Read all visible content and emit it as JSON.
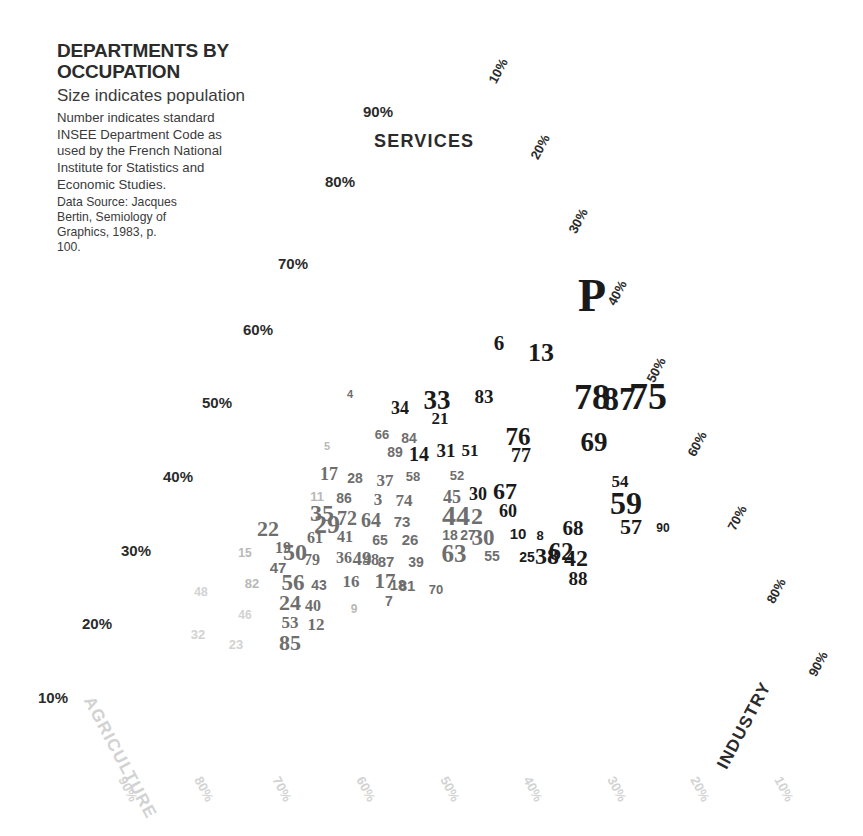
{
  "legend": {
    "title_line1": "DEPARTMENTS BY",
    "title_line2": "OCCUPATION",
    "subtitle": "Size indicates population",
    "note": "Number indicates standard INSEE Department Code as used by the French National Institute for Statistics and Economic Studies.",
    "source": "Data Source: Jacques Bertin, Semiology of Graphics, 1983, p. 100."
  },
  "axes": {
    "services_label": "SERVICES",
    "agriculture_label": "AGRICULTURE",
    "industry_label": "INDUSTRY",
    "paris_label": "P"
  },
  "colors": {
    "dark": "#1a1a1a",
    "mid": "#6e6e6e",
    "light": "#b8b8b8",
    "pale": "#d2d2d2",
    "text": "#2b2b2b"
  },
  "chart_data": {
    "type": "scatter",
    "title": "DEPARTMENTS BY OCCUPATION",
    "subtitle": "Size indicates population",
    "plot_kind": "ternary",
    "axis_names": [
      "AGRICULTURE",
      "INDUSTRY",
      "SERVICES"
    ],
    "grid": false,
    "legend_position": "top-left",
    "annotation": "Number indicates standard INSEE Department Code as used by the French National Institute for Statistics and Economic Studies.",
    "source": "Data Source: Jacques Bertin, Semiology of Graphics, 1983, p. 100.",
    "left_axis_ticks": [
      "10%",
      "20%",
      "30%",
      "40%",
      "50%",
      "60%",
      "70%",
      "80%",
      "90%"
    ],
    "right_axis_ticks": [
      "10%",
      "20%",
      "30%",
      "40%",
      "50%",
      "60%",
      "70%",
      "80%",
      "90%"
    ],
    "bottom_axis_ticks": [
      "90%",
      "80%",
      "70%",
      "60%",
      "50%",
      "40%",
      "30%",
      "20%",
      "10%"
    ],
    "point_label_field": "INSEE Department Code",
    "size_field": "population",
    "points": [
      {
        "label": "P",
        "x": 592,
        "y": 296,
        "size": 47,
        "tone": "dark"
      },
      {
        "label": "6",
        "x": 499,
        "y": 343,
        "size": 21,
        "tone": "dark"
      },
      {
        "label": "13",
        "x": 541,
        "y": 353,
        "size": 26,
        "tone": "dark"
      },
      {
        "label": "78",
        "x": 592,
        "y": 397,
        "size": 36,
        "tone": "dark"
      },
      {
        "label": "87",
        "x": 619,
        "y": 399,
        "size": 33,
        "tone": "dark"
      },
      {
        "label": "75",
        "x": 648,
        "y": 396,
        "size": 38,
        "tone": "dark"
      },
      {
        "label": "69",
        "x": 594,
        "y": 442,
        "size": 27,
        "tone": "dark"
      },
      {
        "label": "83",
        "x": 484,
        "y": 396,
        "size": 19,
        "tone": "dark"
      },
      {
        "label": "76",
        "x": 518,
        "y": 436,
        "size": 25,
        "tone": "dark"
      },
      {
        "label": "77",
        "x": 521,
        "y": 455,
        "size": 20,
        "tone": "dark"
      },
      {
        "label": "33",
        "x": 437,
        "y": 400,
        "size": 27,
        "tone": "dark"
      },
      {
        "label": "21",
        "x": 440,
        "y": 418,
        "size": 17,
        "tone": "dark"
      },
      {
        "label": "34",
        "x": 400,
        "y": 408,
        "size": 18,
        "tone": "dark"
      },
      {
        "label": "4",
        "x": 350,
        "y": 394,
        "size": 11,
        "tone": "mid"
      },
      {
        "label": "66",
        "x": 382,
        "y": 434,
        "size": 13,
        "tone": "mid"
      },
      {
        "label": "84",
        "x": 409,
        "y": 438,
        "size": 14,
        "tone": "mid"
      },
      {
        "label": "89",
        "x": 395,
        "y": 452,
        "size": 14,
        "tone": "mid"
      },
      {
        "label": "14",
        "x": 419,
        "y": 454,
        "size": 20,
        "tone": "dark"
      },
      {
        "label": "31",
        "x": 446,
        "y": 450,
        "size": 19,
        "tone": "dark"
      },
      {
        "label": "51",
        "x": 470,
        "y": 450,
        "size": 17,
        "tone": "dark"
      },
      {
        "label": "5",
        "x": 327,
        "y": 446,
        "size": 11,
        "tone": "light"
      },
      {
        "label": "52",
        "x": 457,
        "y": 475,
        "size": 13,
        "tone": "mid"
      },
      {
        "label": "54",
        "x": 620,
        "y": 481,
        "size": 17,
        "tone": "dark"
      },
      {
        "label": "59",
        "x": 626,
        "y": 503,
        "size": 32,
        "tone": "dark"
      },
      {
        "label": "57",
        "x": 631,
        "y": 527,
        "size": 22,
        "tone": "dark"
      },
      {
        "label": "90",
        "x": 663,
        "y": 528,
        "size": 12,
        "tone": "dark"
      },
      {
        "label": "67",
        "x": 505,
        "y": 491,
        "size": 24,
        "tone": "dark"
      },
      {
        "label": "60",
        "x": 508,
        "y": 511,
        "size": 18,
        "tone": "dark"
      },
      {
        "label": "17",
        "x": 329,
        "y": 474,
        "size": 18,
        "tone": "mid"
      },
      {
        "label": "28",
        "x": 355,
        "y": 478,
        "size": 14,
        "tone": "mid"
      },
      {
        "label": "37",
        "x": 385,
        "y": 480,
        "size": 17,
        "tone": "mid"
      },
      {
        "label": "58",
        "x": 413,
        "y": 476,
        "size": 13,
        "tone": "mid"
      },
      {
        "label": "11",
        "x": 317,
        "y": 496,
        "size": 13,
        "tone": "light"
      },
      {
        "label": "86",
        "x": 344,
        "y": 498,
        "size": 14,
        "tone": "mid"
      },
      {
        "label": "3",
        "x": 378,
        "y": 499,
        "size": 17,
        "tone": "mid"
      },
      {
        "label": "74",
        "x": 404,
        "y": 500,
        "size": 17,
        "tone": "mid"
      },
      {
        "label": "45",
        "x": 452,
        "y": 497,
        "size": 18,
        "tone": "mid"
      },
      {
        "label": "30",
        "x": 478,
        "y": 494,
        "size": 18,
        "tone": "dark"
      },
      {
        "label": "35",
        "x": 322,
        "y": 513,
        "size": 24,
        "tone": "mid"
      },
      {
        "label": "29",
        "x": 327,
        "y": 525,
        "size": 26,
        "tone": "mid"
      },
      {
        "label": "72",
        "x": 347,
        "y": 518,
        "size": 20,
        "tone": "mid"
      },
      {
        "label": "64",
        "x": 371,
        "y": 520,
        "size": 20,
        "tone": "mid"
      },
      {
        "label": "73",
        "x": 402,
        "y": 521,
        "size": 15,
        "tone": "mid"
      },
      {
        "label": "44",
        "x": 456,
        "y": 516,
        "size": 28,
        "tone": "mid"
      },
      {
        "label": "2",
        "x": 477,
        "y": 516,
        "size": 24,
        "tone": "mid"
      },
      {
        "label": "22",
        "x": 268,
        "y": 529,
        "size": 22,
        "tone": "mid"
      },
      {
        "label": "61",
        "x": 315,
        "y": 538,
        "size": 16,
        "tone": "mid"
      },
      {
        "label": "41",
        "x": 345,
        "y": 537,
        "size": 16,
        "tone": "mid"
      },
      {
        "label": "65",
        "x": 380,
        "y": 540,
        "size": 14,
        "tone": "mid"
      },
      {
        "label": "26",
        "x": 410,
        "y": 539,
        "size": 15,
        "tone": "mid"
      },
      {
        "label": "18",
        "x": 450,
        "y": 535,
        "size": 14,
        "tone": "mid"
      },
      {
        "label": "27",
        "x": 468,
        "y": 535,
        "size": 14,
        "tone": "mid"
      },
      {
        "label": "30b",
        "x": 483,
        "y": 537,
        "size": 23,
        "tone": "mid"
      },
      {
        "label": "10",
        "x": 518,
        "y": 533,
        "size": 15,
        "tone": "dark"
      },
      {
        "label": "8",
        "x": 540,
        "y": 535,
        "size": 13,
        "tone": "dark"
      },
      {
        "label": "68",
        "x": 573,
        "y": 528,
        "size": 21,
        "tone": "dark"
      },
      {
        "label": "15",
        "x": 245,
        "y": 553,
        "size": 12,
        "tone": "light"
      },
      {
        "label": "19",
        "x": 283,
        "y": 548,
        "size": 16,
        "tone": "mid"
      },
      {
        "label": "50",
        "x": 295,
        "y": 552,
        "size": 24,
        "tone": "mid"
      },
      {
        "label": "79",
        "x": 312,
        "y": 560,
        "size": 16,
        "tone": "mid"
      },
      {
        "label": "36",
        "x": 344,
        "y": 558,
        "size": 16,
        "tone": "mid"
      },
      {
        "label": "49",
        "x": 362,
        "y": 558,
        "size": 19,
        "tone": "mid"
      },
      {
        "label": "48b",
        "x": 371,
        "y": 560,
        "size": 16,
        "tone": "mid"
      },
      {
        "label": "87b",
        "x": 386,
        "y": 561,
        "size": 15,
        "tone": "mid"
      },
      {
        "label": "39",
        "x": 416,
        "y": 562,
        "size": 14,
        "tone": "mid"
      },
      {
        "label": "63",
        "x": 454,
        "y": 553,
        "size": 25,
        "tone": "mid"
      },
      {
        "label": "55",
        "x": 492,
        "y": 556,
        "size": 14,
        "tone": "mid"
      },
      {
        "label": "25",
        "x": 527,
        "y": 557,
        "size": 14,
        "tone": "dark"
      },
      {
        "label": "38",
        "x": 547,
        "y": 556,
        "size": 24,
        "tone": "dark"
      },
      {
        "label": "62",
        "x": 561,
        "y": 551,
        "size": 25,
        "tone": "dark"
      },
      {
        "label": "42",
        "x": 576,
        "y": 558,
        "size": 24,
        "tone": "dark"
      },
      {
        "label": "88",
        "x": 578,
        "y": 578,
        "size": 19,
        "tone": "dark"
      },
      {
        "label": "47",
        "x": 278,
        "y": 567,
        "size": 15,
        "tone": "mid"
      },
      {
        "label": "82",
        "x": 252,
        "y": 583,
        "size": 13,
        "tone": "light"
      },
      {
        "label": "56",
        "x": 293,
        "y": 582,
        "size": 23,
        "tone": "mid"
      },
      {
        "label": "43",
        "x": 319,
        "y": 585,
        "size": 14,
        "tone": "mid"
      },
      {
        "label": "16",
        "x": 351,
        "y": 581,
        "size": 17,
        "tone": "mid"
      },
      {
        "label": "17b",
        "x": 385,
        "y": 581,
        "size": 21,
        "tone": "mid"
      },
      {
        "label": "18b",
        "x": 398,
        "y": 584,
        "size": 15,
        "tone": "mid"
      },
      {
        "label": "81",
        "x": 407,
        "y": 585,
        "size": 15,
        "tone": "mid"
      },
      {
        "label": "70",
        "x": 436,
        "y": 589,
        "size": 13,
        "tone": "mid"
      },
      {
        "label": "48",
        "x": 201,
        "y": 592,
        "size": 12,
        "tone": "pale"
      },
      {
        "label": "24",
        "x": 290,
        "y": 603,
        "size": 22,
        "tone": "mid"
      },
      {
        "label": "40",
        "x": 313,
        "y": 606,
        "size": 16,
        "tone": "mid"
      },
      {
        "label": "9",
        "x": 354,
        "y": 609,
        "size": 12,
        "tone": "light"
      },
      {
        "label": "7",
        "x": 389,
        "y": 601,
        "size": 14,
        "tone": "mid"
      },
      {
        "label": "46",
        "x": 245,
        "y": 615,
        "size": 12,
        "tone": "pale"
      },
      {
        "label": "53",
        "x": 290,
        "y": 622,
        "size": 17,
        "tone": "mid"
      },
      {
        "label": "12",
        "x": 316,
        "y": 624,
        "size": 17,
        "tone": "mid"
      },
      {
        "label": "32",
        "x": 198,
        "y": 634,
        "size": 13,
        "tone": "pale"
      },
      {
        "label": "23",
        "x": 236,
        "y": 644,
        "size": 13,
        "tone": "pale"
      },
      {
        "label": "85",
        "x": 290,
        "y": 643,
        "size": 22,
        "tone": "mid"
      }
    ]
  },
  "ticks": {
    "left": [
      {
        "text": "90%",
        "x": 363,
        "y": 103
      },
      {
        "text": "80%",
        "x": 325,
        "y": 173
      },
      {
        "text": "70%",
        "x": 278,
        "y": 255
      },
      {
        "text": "60%",
        "x": 243,
        "y": 321
      },
      {
        "text": "50%",
        "x": 202,
        "y": 394
      },
      {
        "text": "40%",
        "x": 163,
        "y": 468
      },
      {
        "text": "30%",
        "x": 121,
        "y": 542
      },
      {
        "text": "20%",
        "x": 82,
        "y": 615
      },
      {
        "text": "10%",
        "x": 38,
        "y": 689
      }
    ],
    "right": [
      {
        "text": "10%",
        "x": 492,
        "y": 75,
        "rot": -62
      },
      {
        "text": "20%",
        "x": 534,
        "y": 151,
        "rot": -62
      },
      {
        "text": "30%",
        "x": 572,
        "y": 225,
        "rot": -62
      },
      {
        "text": "40%",
        "x": 611,
        "y": 297,
        "rot": -62
      },
      {
        "text": "50%",
        "x": 650,
        "y": 374,
        "rot": -62
      },
      {
        "text": "60%",
        "x": 691,
        "y": 448,
        "rot": -62
      },
      {
        "text": "70%",
        "x": 731,
        "y": 522,
        "rot": -62
      },
      {
        "text": "80%",
        "x": 770,
        "y": 595,
        "rot": -62
      },
      {
        "text": "90%",
        "x": 812,
        "y": 668,
        "rot": -62
      }
    ],
    "bottom": [
      {
        "text": "90%",
        "x": 122,
        "y": 770,
        "rot": 62
      },
      {
        "text": "80%",
        "x": 198,
        "y": 770,
        "rot": 62
      },
      {
        "text": "70%",
        "x": 276,
        "y": 770,
        "rot": 62
      },
      {
        "text": "60%",
        "x": 360,
        "y": 770,
        "rot": 62
      },
      {
        "text": "50%",
        "x": 444,
        "y": 770,
        "rot": 62
      },
      {
        "text": "40%",
        "x": 527,
        "y": 770,
        "rot": 62
      },
      {
        "text": "30%",
        "x": 611,
        "y": 770,
        "rot": 62
      },
      {
        "text": "20%",
        "x": 694,
        "y": 770,
        "rot": 62
      },
      {
        "text": "10%",
        "x": 778,
        "y": 770,
        "rot": 62
      }
    ]
  }
}
